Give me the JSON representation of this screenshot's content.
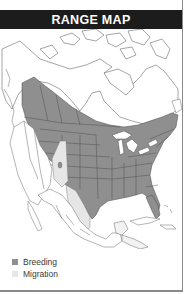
{
  "header": {
    "title": "RANGE MAP"
  },
  "map": {
    "region": "North America",
    "layers": [
      {
        "name": "Breeding",
        "color": "#8f8f8f"
      },
      {
        "name": "Migration",
        "color": "#e6e6e6"
      }
    ],
    "land_color": "#ffffff",
    "outline_color": "#5a5a5a"
  },
  "legend": {
    "items": [
      {
        "label": "Breeding",
        "color": "#8f8f8f"
      },
      {
        "label": "Migration",
        "color": "#e6e6e6"
      }
    ]
  },
  "colors": {
    "header_bg": "#1c1c1c",
    "header_text": "#ffffff",
    "frame": "#8a8a8a"
  }
}
